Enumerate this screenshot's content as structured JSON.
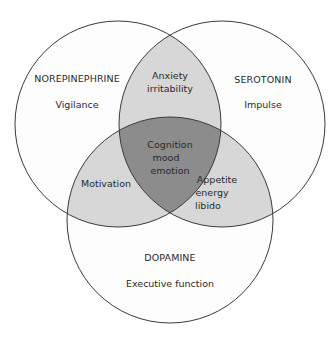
{
  "diagram": {
    "type": "venn",
    "colors": {
      "background": "#ffffff",
      "single": "#fdfdfd",
      "pair_overlap": "#d7d7d7",
      "triple_overlap": "#8c8c8c",
      "stroke": "#3a3a3a",
      "text": "#2a2a2a"
    },
    "circles": [
      {
        "id": "norepinephrine",
        "label": "NOREPINEPHRINE",
        "sublabel": "Vigilance",
        "cx": 118,
        "cy": 124,
        "r": 103
      },
      {
        "id": "serotonin",
        "label": "SEROTONIN",
        "sublabel": "Impulse",
        "cx": 222,
        "cy": 124,
        "r": 103
      },
      {
        "id": "dopamine",
        "label": "DOPAMINE",
        "sublabel": "Executive function",
        "cx": 170,
        "cy": 220,
        "r": 103
      }
    ],
    "overlaps": {
      "ne_se": {
        "lines": [
          "Anxiety",
          "irritability"
        ]
      },
      "ne_da": {
        "lines": [
          "Motivation"
        ]
      },
      "se_da": {
        "lines": [
          "Appetite",
          "energy",
          "libido"
        ]
      },
      "all": {
        "lines": [
          "Cognition",
          "mood",
          "emotion"
        ]
      }
    }
  }
}
